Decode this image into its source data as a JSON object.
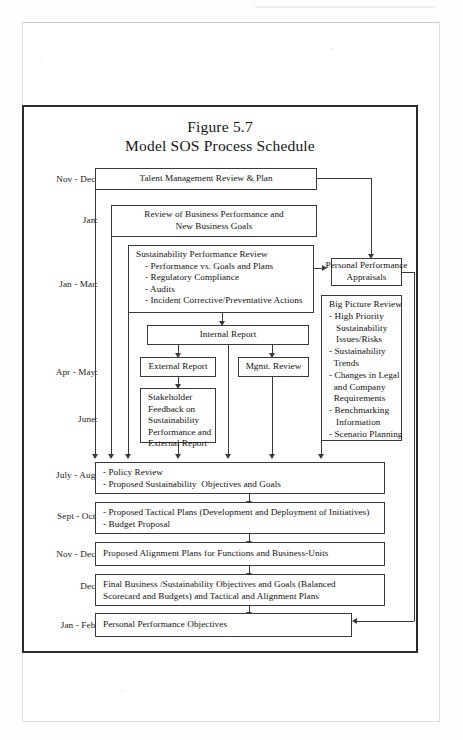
{
  "document": {
    "figure_number": "Figure 5.7",
    "figure_title": "Model SOS Process Schedule"
  },
  "periods": [
    {
      "id": "nov-dec-1",
      "label": "Nov - Dec:"
    },
    {
      "id": "jan",
      "label": "Jan:"
    },
    {
      "id": "jan-mar",
      "label": "Jan - Mar:"
    },
    {
      "id": "apr-may",
      "label": "Apr - May:"
    },
    {
      "id": "june",
      "label": "June:"
    },
    {
      "id": "july-aug",
      "label": "July - Aug:"
    },
    {
      "id": "sept-oct",
      "label": "Sept - Oct:"
    },
    {
      "id": "nov-dec-2",
      "label": "Nov - Dec:"
    },
    {
      "id": "dec",
      "label": "Dec:"
    },
    {
      "id": "jan-feb",
      "label": "Jan - Feb:"
    }
  ],
  "boxes": {
    "talent_management": {
      "title": "Talent Management Review & Plan"
    },
    "business_review": {
      "line1": "Review of Business Performance and",
      "line2": "New Business Goals"
    },
    "sustainability_review": {
      "heading": "Sustainability Performance Review",
      "items": [
        "- Performance vs. Goals and Plans",
        "- Regulatory Compliance",
        "- Audits",
        "- Incident Corrective/Preventative Actions"
      ]
    },
    "personal_appraisals": {
      "line1": "Personal Performance",
      "line2": "Appraisals"
    },
    "big_picture": {
      "heading": "Big Picture Review",
      "items": [
        "- High Priority",
        "   Sustainability",
        "   Issues/Risks",
        "- Sustainability",
        "  Trends",
        "- Changes in Legal",
        "  and Company",
        "  Requirements",
        "- Benchmarking",
        "   Information",
        "- Scenario Planning"
      ]
    },
    "internal_report": {
      "title": "Internal Report"
    },
    "external_report": {
      "title": "External Report"
    },
    "mgmt_review": {
      "title": "Mgmt. Review"
    },
    "stakeholder_feedback": {
      "items": [
        "Stakeholder",
        "Feedback on",
        "Sustainability",
        "Performance and",
        "External Report"
      ]
    },
    "policy_review": {
      "items": [
        "- Policy Review",
        "- Proposed Sustainability  Objectives and Goals"
      ]
    },
    "tactical_plans": {
      "items": [
        "- Proposed Tactical Plans (Development and Deployment of Initiatives)",
        "- Budget Proposal"
      ]
    },
    "alignment_plans": {
      "title": "Proposed Alignment Plans for Functions and Business-Units"
    },
    "final_business": {
      "line1": "Final Business /Sustainability Objectives and Goals (Balanced",
      "line2": "Scorecard and Budgets) and Tactical and Alignment Plans"
    },
    "personal_objectives": {
      "title": "Personal Performance Objectives"
    }
  },
  "colors": {
    "ink": "#111111",
    "rule": "#3a3a3a",
    "frame": "#2b2b2b",
    "paper": "#ffffff"
  }
}
